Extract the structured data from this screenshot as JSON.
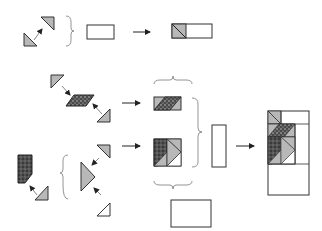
{
  "diagram": {
    "title": "",
    "type": "quilt block piecing assembly diagram",
    "colors": {
      "background": "#ffffff",
      "outline": "#333333",
      "gray_fill": "#b8b8b8",
      "dark_fabric": "#3a3a3a",
      "arrow": "#222222",
      "bracket": "#777777",
      "white_fill": "#ffffff"
    },
    "steps": [
      {
        "id": "step-1",
        "description": "Two gray half-square triangles joined, then joined with white rectangle",
        "inputs": [
          "gray-triangle-upper-right",
          "gray-triangle-lower-left",
          "white-rectangle"
        ],
        "output": "rectangle-with-half-square-triangle-unit"
      },
      {
        "id": "step-2a",
        "description": "Two gray triangles joined to dark patterned parallelogram",
        "inputs": [
          "gray-triangle-top-left",
          "dark-parallelogram",
          "gray-triangle-bottom-right"
        ],
        "output": "parallelogram-strip-unit"
      },
      {
        "id": "step-2b",
        "description": "Dark patterned pentagon joined with gray triangle; gray and white triangles joined to large gray triangle",
        "inputs": [
          "dark-pentagon",
          "gray-triangle-small",
          "gray-triangle-top",
          "large-gray-triangle",
          "white-triangle"
        ],
        "output": "square-unit-with-flying-geese"
      },
      {
        "id": "step-3",
        "description": "Units combined with tall white rectangle and wide white rectangle into final block",
        "inputs": [
          "parallelogram-strip-unit",
          "square-unit-with-flying-geese",
          "tall-white-rectangle",
          "wide-white-rectangle"
        ],
        "output": "final-block"
      }
    ]
  }
}
